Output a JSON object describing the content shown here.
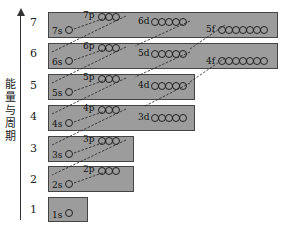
{
  "axis": {
    "label": "能量与周期"
  },
  "periods": [
    "7",
    "6",
    "5",
    "4",
    "3",
    "2",
    "1"
  ],
  "levels": [
    {
      "period": "7",
      "s": "7s",
      "p": "7p",
      "d": "6d",
      "f": "5f"
    },
    {
      "period": "6",
      "s": "6s",
      "p": "6p",
      "d": "5d",
      "f": "4f"
    },
    {
      "period": "5",
      "s": "5s",
      "p": "5p",
      "d": "4d"
    },
    {
      "period": "4",
      "s": "4s",
      "p": "4p",
      "d": "3d"
    },
    {
      "period": "3",
      "s": "3s",
      "p": "3p"
    },
    {
      "period": "2",
      "s": "2s",
      "p": "2p"
    },
    {
      "period": "1",
      "s": "1s"
    }
  ],
  "colors": {
    "box_fill": "#9c9c9c",
    "box_border": "#444444",
    "line": "#222222"
  }
}
